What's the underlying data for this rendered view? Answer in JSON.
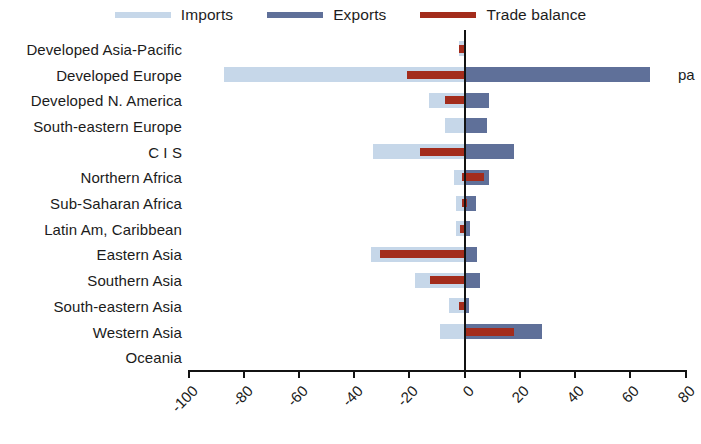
{
  "legend": {
    "items": [
      {
        "label": "Imports",
        "color": "#c6d7e9",
        "name": "legend-imports"
      },
      {
        "label": "Exports",
        "color": "#5f7099",
        "name": "legend-exports"
      },
      {
        "label": "Trade balance",
        "color": "#a32c1c",
        "name": "legend-trade-balance"
      }
    ]
  },
  "edge_note": "pa",
  "chart_data": {
    "type": "bar",
    "orientation": "horizontal",
    "title": "",
    "subtitle": "",
    "xlabel": "",
    "ylabel": "",
    "xlim": [
      -100,
      80
    ],
    "xticks": [
      -100,
      -80,
      -60,
      -40,
      -20,
      0,
      20,
      40,
      60,
      80
    ],
    "xtick_labels": [
      "-100",
      "-80",
      "-60",
      "-40",
      "-20",
      "0",
      "20",
      "40",
      "60",
      "80"
    ],
    "grid": false,
    "legend_position": "top",
    "categories": [
      "Developed Asia-Pacific",
      "Developed Europe",
      "Developed N. America",
      "South-eastern Europe",
      "C I S",
      "Northern Africa",
      "Sub-Saharan Africa",
      "Latin Am, Caribbean",
      "Eastern Asia",
      "Southern Asia",
      "South-eastern Asia",
      "Western Asia",
      "Oceania"
    ],
    "series": [
      {
        "name": "Imports",
        "color": "#c6d7e9",
        "values": [
          -2,
          -87,
          -13,
          -7,
          -33,
          -4,
          -3,
          -3,
          -34,
          -18,
          -5.5,
          -9,
          0
        ]
      },
      {
        "name": "Exports",
        "color": "#5f7099",
        "values": [
          0.5,
          67,
          9,
          8,
          18,
          9,
          4,
          2,
          4.5,
          5.5,
          1.5,
          28,
          0
        ]
      },
      {
        "name": "Trade balance",
        "color": "#a32c1c",
        "values": [
          -2,
          -21,
          -7,
          0,
          -16,
          7,
          1,
          -1,
          -30.5,
          -12.5,
          -2,
          18,
          0
        ]
      }
    ],
    "balance_spans": [
      {
        "from": -2,
        "to": 0
      },
      {
        "from": -21,
        "to": 0
      },
      {
        "from": -7,
        "to": 0
      },
      {
        "from": 0,
        "to": 0
      },
      {
        "from": -16,
        "to": 0
      },
      {
        "from": -1,
        "to": 7
      },
      {
        "from": -1,
        "to": 1
      },
      {
        "from": -1.5,
        "to": 0
      },
      {
        "from": -30.5,
        "to": 0
      },
      {
        "from": -12.5,
        "to": 0
      },
      {
        "from": -2,
        "to": 0
      },
      {
        "from": 0.5,
        "to": 18
      }
    ]
  }
}
